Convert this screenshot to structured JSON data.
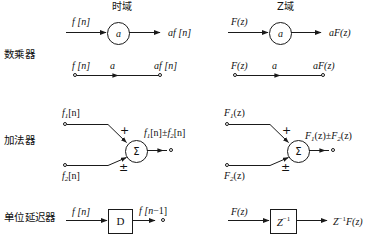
{
  "figure": {
    "columns": [
      {
        "id": "time-domain",
        "title": "时域"
      },
      {
        "id": "z-domain",
        "title": "Z域"
      }
    ],
    "rows": [
      {
        "id": "scalar-multiplier",
        "label": "数乘器"
      },
      {
        "id": "adder",
        "label": "加法器"
      },
      {
        "id": "unit-delay",
        "label": "单位延迟器"
      }
    ],
    "blocks": {
      "multiplier_time_arrow": {
        "input": "f [n]",
        "node": "a",
        "output": "af [n]"
      },
      "multiplier_z_arrow": {
        "input": "F(z)",
        "node": "a",
        "output": "aF(z)"
      },
      "multiplier_time_line": {
        "input": "f [n]",
        "gain": "a",
        "output": "af [n]"
      },
      "multiplier_z_line": {
        "input": "F(z)",
        "gain": "a",
        "output": "aF(z)"
      },
      "adder_time": {
        "input_top": "f",
        "input_top_sub": "1",
        "input_top_tail": "[n]",
        "input_bottom": "f",
        "input_bottom_sub": "2",
        "input_bottom_tail": "[n]",
        "node": "Σ",
        "sign_top": "+",
        "sign_bottom": "±",
        "output_a": "f",
        "output_a_sub": "1",
        "output_a_tail": "[n]",
        "output_op": "±",
        "output_b": "f",
        "output_b_sub": "2",
        "output_b_tail": "[n]"
      },
      "adder_z": {
        "input_top": "F",
        "input_top_sub": "1",
        "input_top_tail": "(z)",
        "input_bottom": "F",
        "input_bottom_sub": "2",
        "input_bottom_tail": "(z)",
        "node": "Σ",
        "sign_top": "+",
        "sign_bottom": "±",
        "output_a": "F",
        "output_a_sub": "1",
        "output_a_tail": "(z)",
        "output_op": "±",
        "output_b": "F",
        "output_b_sub": "2",
        "output_b_tail": "(z)"
      },
      "delay_time": {
        "input": "f [n]",
        "node": "D",
        "output_main": "f [n",
        "output_op": "−1",
        "output_tail": "]"
      },
      "delay_z": {
        "input": "F(z)",
        "node": "Z",
        "node_exp": "−1",
        "output": "Z",
        "output_exp": "−1",
        "output_tail": "F(z)"
      }
    },
    "colors": {
      "ink": "#1a1a1a",
      "background": "#ffffff"
    }
  }
}
